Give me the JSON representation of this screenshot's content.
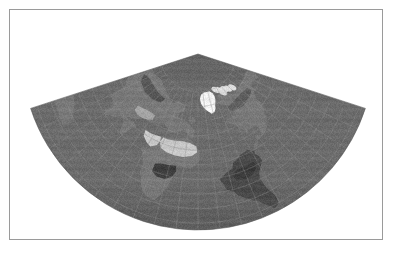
{
  "figure": {
    "kind": "map-figure",
    "title": "",
    "caption": "",
    "frame_color": "#9a9a9a",
    "background_color": "#ffffff",
    "width_px": 394,
    "height_px": 253
  },
  "map": {
    "name": "world-map",
    "projection": "Lambert Conformal Conic",
    "rendering": "grayscale shaded relief / satellite land cover",
    "colors": {
      "ocean": "#6b6b6b",
      "ocean_dark": "#585858",
      "land_dark": "#4a4a4a",
      "land_mid": "#787878",
      "land_light": "#b9b9b9",
      "desert": "#c8c8c8",
      "ice": "#f2f2f2",
      "graticule": "#8d8d8d",
      "outside": "#ffffff"
    },
    "graticule": {
      "visible": true,
      "meridian_spacing_deg": 15,
      "parallel_spacing_deg": 15,
      "line_color": "#8d8d8d"
    },
    "sector": {
      "apex_x": 198,
      "apex_y": 54,
      "outer_radius": 176,
      "inner_radius": 0,
      "half_angle_deg": 72
    },
    "features": [
      {
        "name": "greenland-ice-sheet",
        "tone": "ice"
      },
      {
        "name": "north-america",
        "tone": "land_mid"
      },
      {
        "name": "south-america",
        "tone": "land_dark"
      },
      {
        "name": "africa-sahara",
        "tone": "desert"
      },
      {
        "name": "africa-equatorial",
        "tone": "land_dark"
      },
      {
        "name": "europe",
        "tone": "land_mid"
      },
      {
        "name": "asia",
        "tone": "land_mid"
      },
      {
        "name": "arabian-peninsula",
        "tone": "desert"
      },
      {
        "name": "atlantic-ocean",
        "tone": "ocean"
      },
      {
        "name": "pacific-ocean",
        "tone": "ocean"
      },
      {
        "name": "indian-ocean",
        "tone": "ocean"
      }
    ]
  }
}
